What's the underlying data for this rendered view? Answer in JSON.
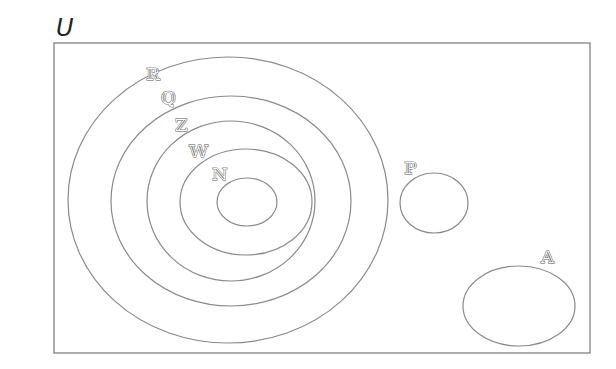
{
  "diagram": {
    "type": "venn",
    "universe": {
      "label": "U",
      "x": 54,
      "y": 43,
      "width": 536,
      "height": 310
    },
    "sets": [
      {
        "id": "R",
        "label": "ℝ",
        "name": "real-numbers",
        "cx": 228,
        "cy": 200,
        "rx": 160,
        "ry": 143,
        "label_x": 146,
        "label_y": 80,
        "contains": [
          "Q",
          "P"
        ]
      },
      {
        "id": "Q",
        "label": "ℚ",
        "name": "rational-numbers",
        "cx": 231,
        "cy": 201,
        "rx": 120,
        "ry": 105,
        "label_x": 161,
        "label_y": 104,
        "contains": [
          "Z"
        ]
      },
      {
        "id": "Z",
        "label": "ℤ",
        "name": "integers",
        "cx": 231,
        "cy": 201,
        "rx": 84,
        "ry": 80,
        "label_x": 175,
        "label_y": 131,
        "contains": [
          "W"
        ]
      },
      {
        "id": "W",
        "label": "𝕎",
        "name": "whole-numbers",
        "cx": 246,
        "cy": 202,
        "rx": 66,
        "ry": 53,
        "label_x": 189,
        "label_y": 157,
        "contains": [
          "N"
        ]
      },
      {
        "id": "N",
        "label": "ℕ",
        "name": "natural-numbers",
        "cx": 247,
        "cy": 202,
        "rx": 30,
        "ry": 24,
        "label_x": 212,
        "label_y": 180,
        "contains": []
      },
      {
        "id": "P",
        "label": "ℙ",
        "name": "prime-set",
        "cx": 434,
        "cy": 203,
        "rx": 34,
        "ry": 30,
        "label_x": 404,
        "label_y": 174,
        "contains": []
      },
      {
        "id": "A",
        "label": "𝔸",
        "name": "set-a",
        "cx": 519,
        "cy": 306,
        "rx": 56,
        "ry": 40,
        "label_x": 541,
        "label_y": 263,
        "contains": []
      }
    ],
    "colors": {
      "stroke": "#8a8a8a",
      "label_stroke": "#555555",
      "background": "#ffffff"
    }
  }
}
